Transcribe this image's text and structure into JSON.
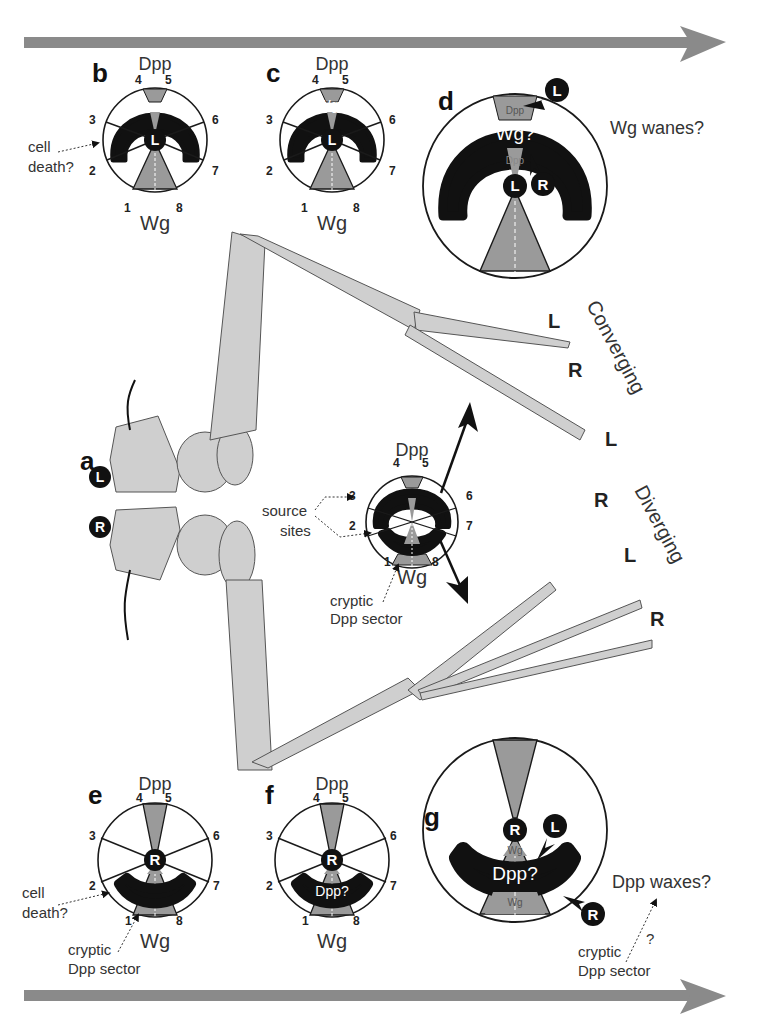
{
  "figure": {
    "arrows": {
      "color": "#8a8a8a"
    },
    "colors": {
      "sector": "#9a9a9a",
      "leg": "#cfcfcf",
      "domain": "#111111",
      "outline": "#1a1a1a"
    },
    "panels": {
      "a": {
        "label": "a",
        "left_badge": "L",
        "right_badge": "R",
        "center_wheel": {
          "top": "Dpp",
          "bottom": "Wg",
          "numbers": [
            "1",
            "2",
            "3",
            "4",
            "5",
            "6",
            "7",
            "8"
          ],
          "annotations": {
            "source_sites": "source sites",
            "source_line1": "source",
            "source_line2": "sites",
            "cryptic_line1": "cryptic",
            "cryptic_line2": "Dpp sector"
          }
        }
      },
      "b": {
        "label": "b",
        "top": "Dpp",
        "bottom": "Wg",
        "center": "L",
        "numbers": [
          "1",
          "2",
          "3",
          "4",
          "5",
          "6",
          "7",
          "8"
        ],
        "note_line1": "cell",
        "note_line2": "death?"
      },
      "c": {
        "label": "c",
        "top": "Dpp",
        "bottom": "Wg",
        "center": "L",
        "numbers": [
          "1",
          "2",
          "3",
          "4",
          "5",
          "6",
          "7",
          "8"
        ],
        "domain_text": "Wg?"
      },
      "d": {
        "label": "d",
        "center": "L",
        "inner_dpp": "Dpp",
        "outer_dpp": "Dpp",
        "domain_text": "Wg?",
        "pointer_top": "L",
        "pointer_inner": "R",
        "caption": "Wg wanes?"
      },
      "e": {
        "label": "e",
        "top": "Dpp",
        "bottom": "Wg",
        "center": "R",
        "numbers": [
          "1",
          "2",
          "3",
          "4",
          "5",
          "6",
          "7",
          "8"
        ],
        "note_line1": "cell",
        "note_line2": "death?",
        "cryptic_line1": "cryptic",
        "cryptic_line2": "Dpp sector"
      },
      "f": {
        "label": "f",
        "top": "Dpp",
        "bottom": "Wg",
        "center": "R",
        "numbers": [
          "1",
          "2",
          "3",
          "4",
          "5",
          "6",
          "7",
          "8"
        ],
        "domain_text": "Dpp?"
      },
      "g": {
        "label": "g",
        "center": "R",
        "inner_wg": "Wg",
        "outer_wg": "Wg",
        "domain_text": "Dpp?",
        "pointer_inner": "L",
        "pointer_outer": "R",
        "caption": "Dpp waxes?",
        "question": "?",
        "cryptic_line1": "cryptic",
        "cryptic_line2": "Dpp sector"
      }
    },
    "converging": {
      "label": "Converging",
      "tips": [
        "L",
        "R",
        "L"
      ]
    },
    "diverging": {
      "label": "Diverging",
      "tips": [
        "R",
        "L",
        "R"
      ]
    }
  }
}
